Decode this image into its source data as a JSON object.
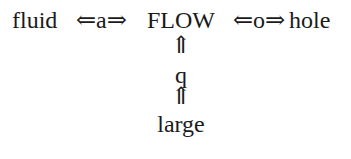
{
  "diagram": {
    "row": {
      "left": "fluid",
      "left_relation": "⇐a⇒",
      "center": "FLOW",
      "right_relation": "⇐o⇒",
      "right": "hole"
    },
    "column": {
      "arrow_top": "⇑",
      "middle": "q",
      "arrow_bottom": "⇑",
      "bottom": "large"
    }
  }
}
